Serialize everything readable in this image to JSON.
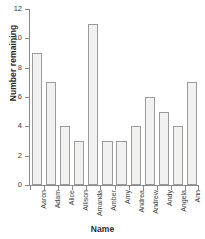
{
  "chart_data": {
    "type": "bar",
    "title": "",
    "xlabel": "Name",
    "ylabel": "Number remaining",
    "categories": [
      "Aaron",
      "Adam",
      "Alice",
      "Allison",
      "Amanda",
      "Amber",
      "Amy",
      "Andrea",
      "Andrew",
      "Andy",
      "Angela",
      "Ann"
    ],
    "values": [
      9,
      7,
      4,
      3,
      11,
      3,
      3,
      4,
      6,
      5,
      4,
      7
    ],
    "ylim": [
      0,
      12
    ],
    "yticks": [
      0,
      2,
      4,
      6,
      8,
      10,
      12
    ],
    "ytick_labels": [
      "0",
      "2",
      "4",
      "6",
      "8",
      "10",
      "12"
    ],
    "grid": false,
    "legend": false,
    "bar_fill_color": "#f1f1ef",
    "bar_border_color": "#9b9b9b",
    "axis_color": "#8a8a8a",
    "text_color": "#3a3a3a"
  }
}
